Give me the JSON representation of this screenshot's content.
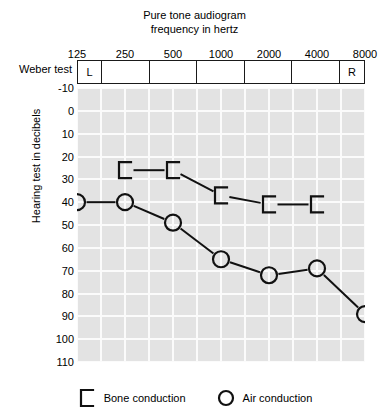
{
  "title": {
    "line1": "Pure tone audiogram",
    "line2": "frequency in hertz"
  },
  "weber": {
    "label": "Weber test",
    "cells": [
      "L",
      "",
      "",
      "",
      "",
      "",
      "R"
    ]
  },
  "axes": {
    "y_title": "Hearing test in decibels",
    "y_ticks": [
      "-10",
      "0",
      "10",
      "20",
      "30",
      "40",
      "50",
      "60",
      "70",
      "80",
      "90",
      "100",
      "110"
    ],
    "x_ticks": [
      "125",
      "250",
      "500",
      "1000",
      "2000",
      "4000",
      "8000"
    ]
  },
  "legend": [
    {
      "name": "bone-conduction",
      "label": "Bone conduction",
      "marker": "bracket"
    },
    {
      "name": "air-conduction",
      "label": "Air conduction",
      "marker": "circle"
    }
  ],
  "chart_data": {
    "type": "line",
    "title": "Pure tone audiogram",
    "subtitle": "frequency in hertz",
    "xlabel": "frequency in hertz",
    "ylabel": "Hearing test in decibels",
    "x_scale": "log2-octave",
    "categories": [
      125,
      250,
      500,
      1000,
      2000,
      4000,
      8000
    ],
    "xlim": [
      125,
      8000
    ],
    "ylim": [
      -10,
      110
    ],
    "y_invert": true,
    "y_tick_step": 10,
    "grid": true,
    "legend_position": "bottom",
    "series": [
      {
        "name": "Bone conduction",
        "marker": "bracket",
        "color": "#111111",
        "x": [
          250,
          500,
          1000,
          2000,
          4000
        ],
        "values": [
          26,
          26,
          37,
          41,
          41
        ]
      },
      {
        "name": "Air conduction",
        "marker": "circle",
        "color": "#111111",
        "x": [
          125,
          250,
          500,
          1000,
          2000,
          4000,
          8000
        ],
        "values": [
          40,
          40,
          49,
          65,
          72,
          69,
          89
        ]
      }
    ]
  }
}
